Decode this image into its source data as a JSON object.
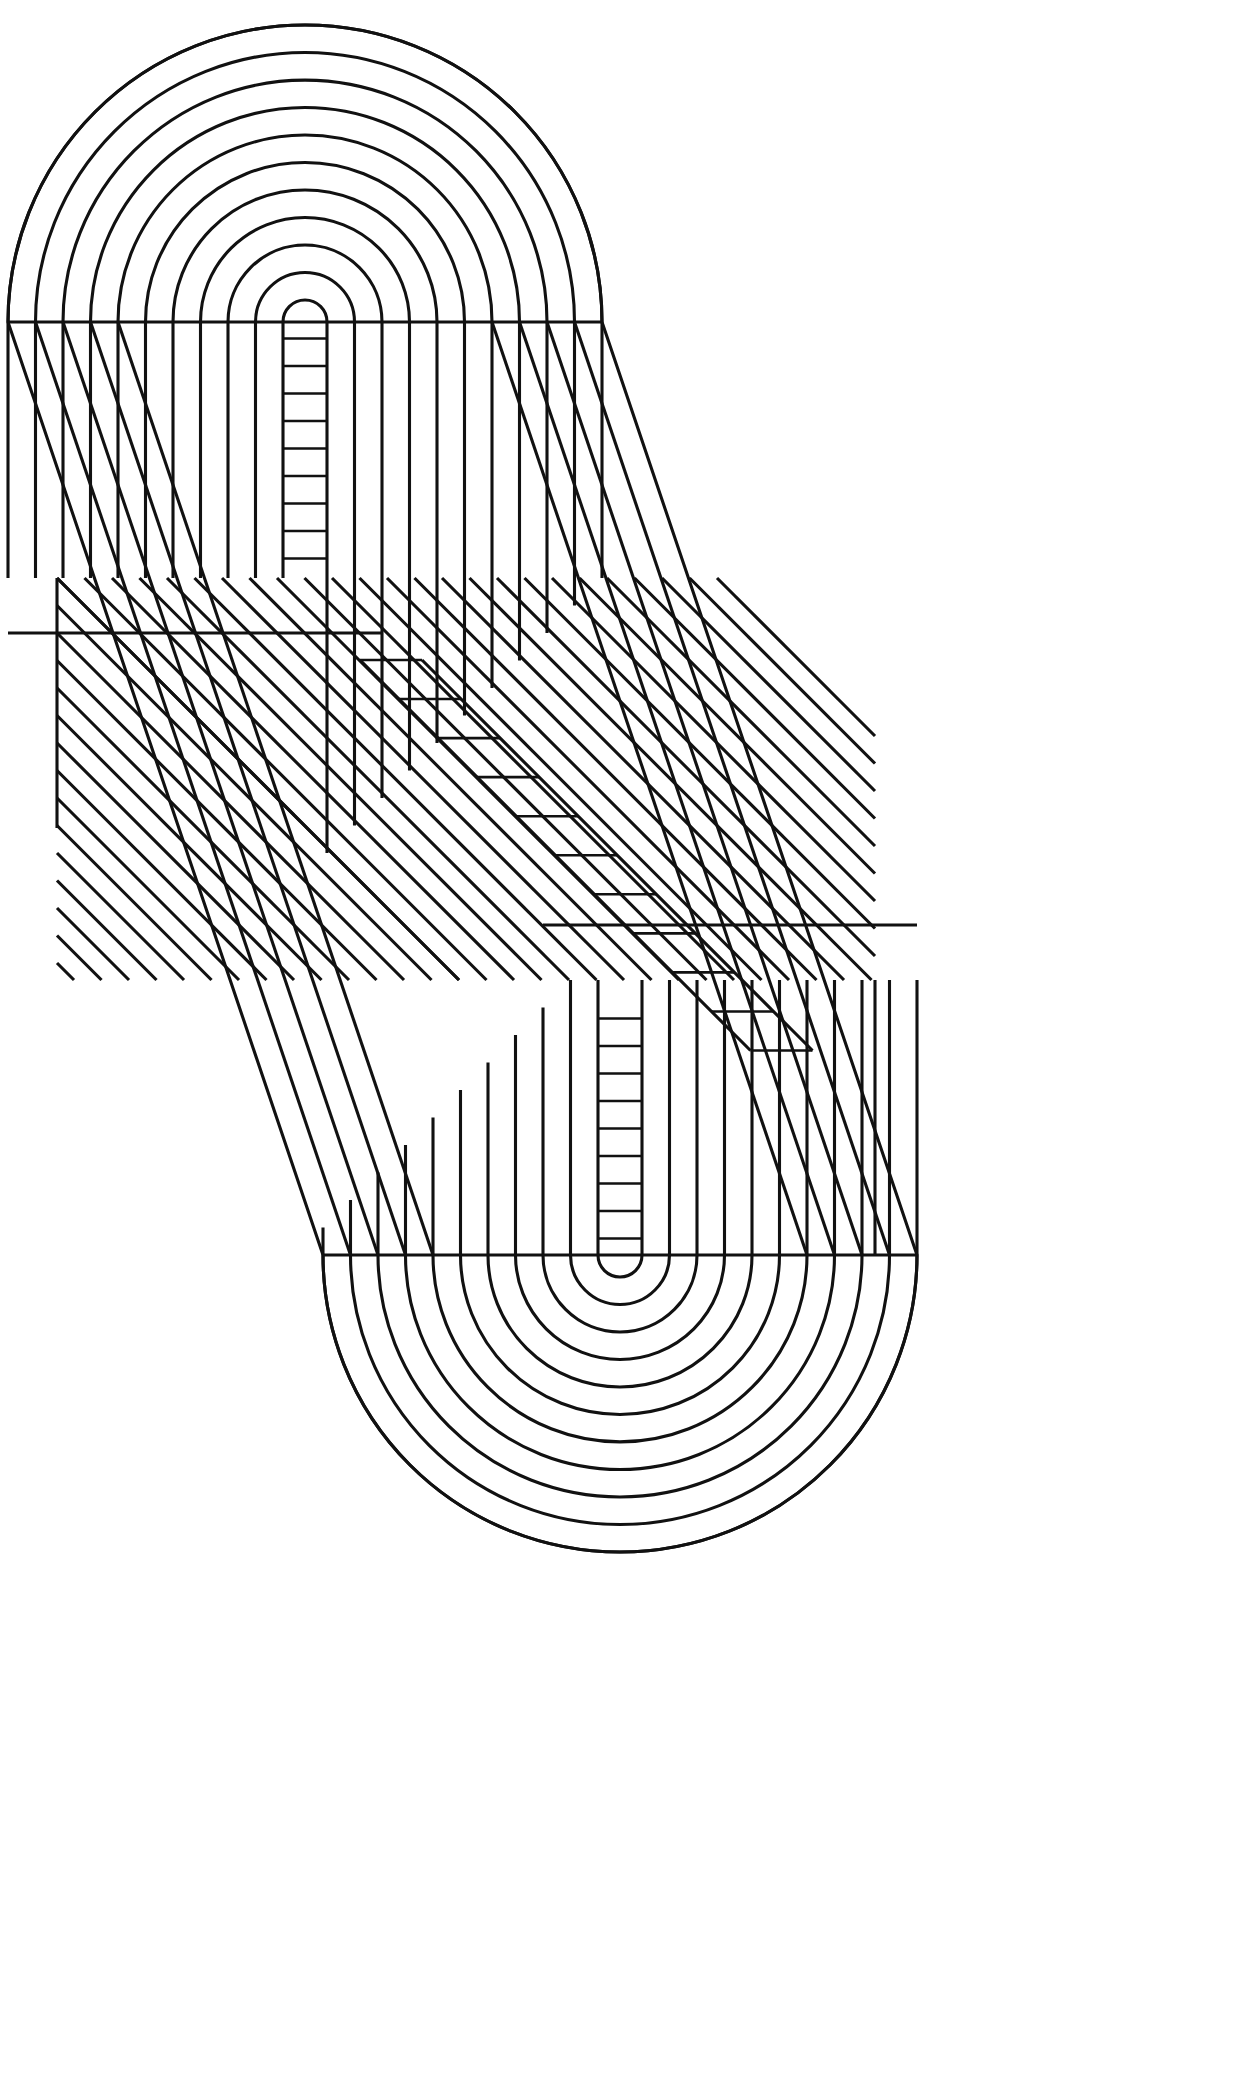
{
  "artwork": {
    "title": "Nested Labyrinth Bands",
    "medium": "line-drawing",
    "canvas": {
      "width": 1256,
      "height": 2092,
      "background": "#ffffff"
    },
    "stroke": {
      "color": "#111111",
      "width": 3.1
    },
    "symmetry": "180-degree rotational about canvas center",
    "description": "Continuous nested band figure: rounded arch cap at upper-left, vertical stripe field, 45-degree diagonal stripe corridor across the middle, mirrored vertical stripe field and rounded arch cap at lower-right."
  },
  "geometry": {
    "band_count": 11,
    "band_pitch": 27.5,
    "ladder_rung_pitch": 27.5,
    "diagonal_angle_deg": 45,
    "top_arch": {
      "center": {
        "x": 305,
        "y": 322
      },
      "outer_radius": 248,
      "inner_radius": 22,
      "baseline_y": 322
    },
    "bottom_arch": {
      "center": {
        "x": 620,
        "y": 1255
      },
      "outer_radius": 248,
      "inner_radius": 22,
      "baseline_y": 1255
    },
    "top_panel": {
      "x0": 57,
      "x1": 553,
      "y0": 322,
      "y1": 578
    },
    "bottom_panel": {
      "x0": 392,
      "x1": 875,
      "y0": 1255,
      "y1": 1528
    },
    "diagonal_corridor": {
      "from": {
        "x": 57,
        "y": 578
      },
      "to": {
        "x": 875,
        "y": 1255
      }
    },
    "outer_silhouette": {
      "left_x": 57,
      "right_x": 875,
      "top_y": 62,
      "bottom_y": 1528
    }
  },
  "chart_data": {
    "type": "line",
    "xlabel": "",
    "ylabel": "",
    "series": [
      {
        "name": "band-00",
        "offset": 0
      },
      {
        "name": "band-01",
        "offset": 27.5
      },
      {
        "name": "band-02",
        "offset": 55
      },
      {
        "name": "band-03",
        "offset": 82.5
      },
      {
        "name": "band-04",
        "offset": 110
      },
      {
        "name": "band-05",
        "offset": 137.5
      },
      {
        "name": "band-06",
        "offset": 165
      },
      {
        "name": "band-07",
        "offset": 192.5
      },
      {
        "name": "band-08",
        "offset": 220
      },
      {
        "name": "band-09",
        "offset": 247.5
      },
      {
        "name": "band-10",
        "offset": 275
      }
    ],
    "categories": [
      "arch-cap",
      "vertical-field",
      "diagonal-corridor",
      "mirror-vertical-field",
      "mirror-arch-cap"
    ]
  },
  "labels": {
    "top_arch": "top-arch-cap",
    "top_field": "upper-vertical-stripe-field",
    "top_ladder": "upper-rung-ladder",
    "corridor": "diagonal-stripe-corridor",
    "corridor_ladder": "diagonal-rung-ladder",
    "bottom_field": "lower-vertical-stripe-field",
    "bottom_ladder": "lower-rung-ladder",
    "bottom_arch": "bottom-arch-cap",
    "silhouette": "outer-silhouette"
  }
}
